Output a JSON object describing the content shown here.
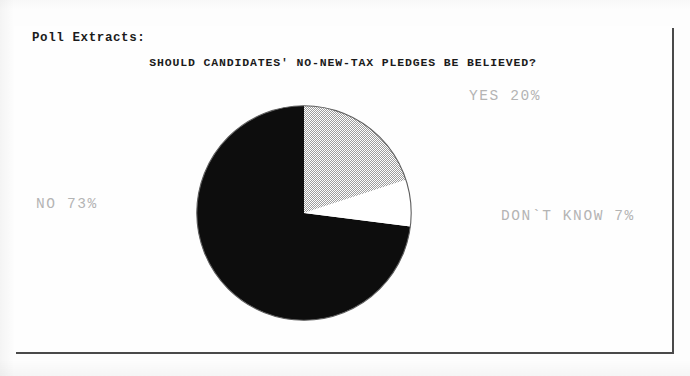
{
  "bleed": {
    "partial_line": "office when the candidate"
  },
  "figure": {
    "section_label": "Poll Extracts:",
    "title": "SHOULD CANDIDATES' NO-NEW-TAX PLEDGES BE BELIEVED?",
    "frame_color": "#3a3a3a",
    "background_color": "#fefefe"
  },
  "labels": {
    "yes": "YES 20%",
    "no": "NO 73%",
    "dont_know": "DON`T KNOW 7%",
    "text_color": "#b4b4b4"
  },
  "chart_data": {
    "type": "pie",
    "title": "SHOULD CANDIDATES' NO-NEW-TAX PLEDGES BE BELIEVED?",
    "xlabel": "",
    "ylabel": "",
    "grid": false,
    "legend_position": "around-slices",
    "start_angle_deg": 0,
    "direction": "clockwise",
    "categories": [
      "YES",
      "NO",
      "DON'T KNOW"
    ],
    "values": [
      20,
      73,
      7
    ],
    "value_unit": "percent",
    "annotations": [
      "YES 20%",
      "NO 73%",
      "DON`T KNOW 7%"
    ],
    "slices": [
      {
        "label": "YES",
        "value": 20,
        "display": "YES 20%",
        "fill": "gray-stipple-dither",
        "fill_color": "#b0b0b0",
        "start_angle_deg": 0,
        "end_angle_deg": 72
      },
      {
        "label": "DON'T KNOW",
        "value": 7,
        "display": "DON`T KNOW 7%",
        "fill": "white",
        "fill_color": "#ffffff",
        "start_angle_deg": 72,
        "end_angle_deg": 97.2
      },
      {
        "label": "NO",
        "value": 73,
        "display": "NO 73%",
        "fill": "solid-black",
        "fill_color": "#0d0d0d",
        "start_angle_deg": 97.2,
        "end_angle_deg": 360
      }
    ]
  }
}
